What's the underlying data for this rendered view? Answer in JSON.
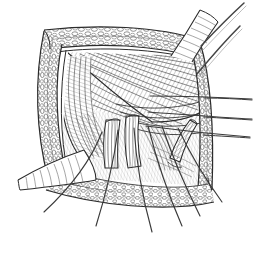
{
  "figure": {
    "title": "Surgical Exposure Line Drawing",
    "kind": "medical-line-art",
    "background_color": "#ffffff",
    "ink_color": "#2b2b2b",
    "ink_color_light": "#6d6d6d",
    "ink_color_faint": "#9a9a9a",
    "canvas": {
      "width": 268,
      "height": 256
    }
  },
  "regions": [
    {
      "id": "fat-border-top",
      "label": "Retracted subcutaneous fat - superior edge",
      "texture": "cobblestone"
    },
    {
      "id": "fat-border-left",
      "label": "Retracted subcutaneous fat - lateral edge",
      "texture": "cobblestone"
    },
    {
      "id": "fat-border-right",
      "label": "Retracted subcutaneous fat - medial edge",
      "texture": "cobblestone"
    },
    {
      "id": "fat-border-bottom",
      "label": "Retracted subcutaneous fat - inferior edge",
      "texture": "cobblestone"
    },
    {
      "id": "muscle-fan-upper",
      "label": "Fanning muscle fibers",
      "texture": "diagonal-hatch"
    },
    {
      "id": "muscle-fan-left",
      "label": "Lateral muscle belly",
      "texture": "curved-hatch"
    },
    {
      "id": "deep-floor",
      "label": "Deep wound floor",
      "texture": "fine-hatch"
    },
    {
      "id": "retractor-band-left",
      "label": "Retractor band exiting laterally",
      "texture": "ribbed"
    },
    {
      "id": "retractor-band-top",
      "label": "Retractor band exiting superiorly",
      "texture": "ribbed"
    },
    {
      "id": "tubular-structure-center",
      "label": "Neurovascular tubular structure",
      "texture": "longitudinal-hatch"
    },
    {
      "id": "tubular-structure-right",
      "label": "Elevated tubular structure on retractor",
      "texture": "longitudinal-hatch"
    }
  ],
  "instruments": [
    {
      "id": "probe-upper-right",
      "label": "Instrument shank, upper right"
    },
    {
      "id": "retractor-blade-right",
      "label": "Retractor blade, right wound margin"
    }
  ],
  "sutures": {
    "count": 6,
    "label": "Stay sutures fanning inferiorly",
    "right_count": 3,
    "right_label": "Stay sutures exiting laterally to the right"
  }
}
